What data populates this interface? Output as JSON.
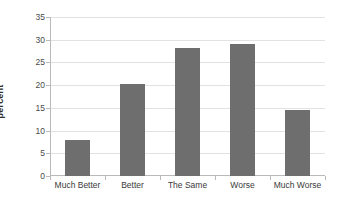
{
  "chart_data": {
    "type": "bar",
    "title": "",
    "xlabel": "",
    "ylabel": "percent",
    "categories": [
      "Much Better",
      "Better",
      "The Same",
      "Worse",
      "Much Worse"
    ],
    "values": [
      8,
      20.2,
      28.2,
      29,
      14.5
    ],
    "ylim": [
      0,
      35
    ],
    "yticks": [
      0,
      5,
      10,
      15,
      20,
      25,
      30,
      35
    ],
    "ytick_labels": [
      "0",
      "5",
      "10",
      "15",
      "20",
      "25",
      "30",
      "35"
    ],
    "grid": true,
    "legend": false,
    "colors": {
      "bar": "#6e6e6e",
      "gridline": "#e2e2e2",
      "axis": "#b9b9b9",
      "background": "#ffffff",
      "text": "#3a3a3a"
    }
  }
}
